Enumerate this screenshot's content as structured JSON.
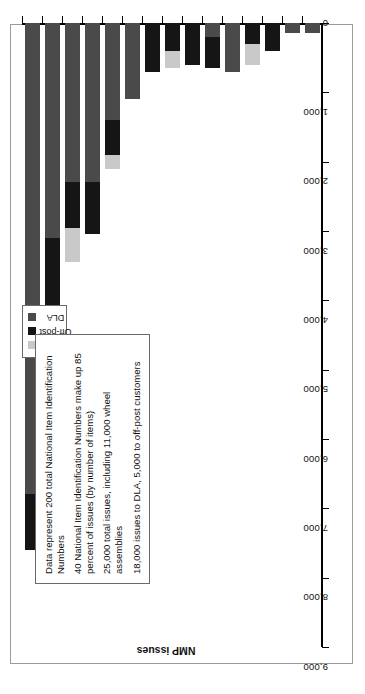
{
  "chart_data": {
    "type": "bar",
    "orientation": "horizontal",
    "title": "",
    "xlabel": "",
    "ylabel": "NMP issues",
    "ylim": [
      0,
      9000
    ],
    "tick_labels": [
      "9,000",
      "8,000",
      "7,000",
      "6,000",
      "5,000",
      "4,000",
      "3,000",
      "2,000",
      "1,000",
      "0"
    ],
    "tick_values": [
      9000,
      8000,
      7000,
      6000,
      5000,
      4000,
      3000,
      2000,
      1000,
      0
    ],
    "grid": false,
    "legend_position": "top-left",
    "stacked": true,
    "categories": [
      "Charleston,\nW. Va.",
      "Fort\nCampbell,\nKy.",
      "Fort Hood,\nTex.",
      "Fort Sill,\nOkla.",
      "Fort Lewis,\nWash.",
      "Johnston,\nIa.",
      "Fort\nRucker,\nAla.",
      "Fort Bliss,\nTex.",
      "Annville,\nPa.",
      "Gulfport,\nMiss.",
      "Clackamas,\nOreg.",
      "Fort Riley,\nKan.",
      "Longmont,\nColo.",
      "Fort\nMcCoy,\nWisc.",
      "Springfield,\nMo."
    ],
    "series": [
      {
        "name": "DLA",
        "color": "#4a4a4a",
        "values": [
          6800,
          3100,
          2300,
          2300,
          1400,
          1100,
          0,
          0,
          0,
          200,
          700,
          0,
          0,
          150,
          150
        ]
      },
      {
        "name": "Off-post",
        "color": "#151515",
        "values": [
          800,
          1100,
          650,
          750,
          500,
          0,
          700,
          400,
          600,
          450,
          0,
          300,
          400,
          0,
          0
        ]
      },
      {
        "name": "Local",
        "color": "#c9c9c9",
        "values": [
          0,
          250,
          500,
          0,
          200,
          0,
          0,
          250,
          0,
          0,
          0,
          300,
          0,
          0,
          0
        ]
      }
    ]
  },
  "legend": {
    "items": [
      {
        "label": "Local",
        "color": "#c9c9c9"
      },
      {
        "label": "Off-post",
        "color": "#151515"
      },
      {
        "label": "DLA",
        "color": "#4a4a4a"
      }
    ]
  },
  "note": {
    "lines": [
      "Data represent 200 total National Item Identification Numbers",
      "40 National Item Identification Numbers make up 85 percent of issues (by number of items)",
      "25,000 total issues, including 11,000 wheel assemblies",
      "18,000 issues to DLA, 5,000 to off-post customers"
    ]
  }
}
